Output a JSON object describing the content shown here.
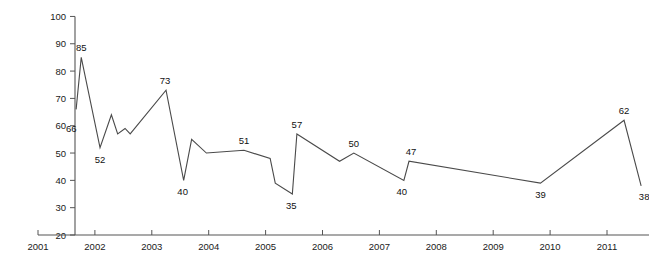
{
  "chart_data": {
    "type": "line",
    "title": "",
    "xlabel": "",
    "ylabel": "",
    "xlim": [
      2001,
      2011.8
    ],
    "ylim": [
      20,
      100
    ],
    "ytick_step": 10,
    "grid": false,
    "legend": null,
    "line_color": "#4a4a4a",
    "axis_color": "#555555",
    "yticks": [
      20,
      30,
      40,
      50,
      60,
      70,
      80,
      90,
      100
    ],
    "ytick_labels": [
      "20",
      "30",
      "40",
      "50",
      "60",
      "70",
      "80",
      "90",
      "100"
    ],
    "xticks": [
      2001,
      2002,
      2003,
      2004,
      2005,
      2006,
      2007,
      2008,
      2009,
      2010,
      2011
    ],
    "xtick_labels": [
      "2001",
      "2002",
      "2003",
      "2004",
      "2005",
      "2006",
      "2007",
      "2008",
      "2009",
      "2010",
      "2011"
    ],
    "series": [
      {
        "name": "series-1",
        "points": [
          {
            "x": 2001.67,
            "y": 66
          },
          {
            "x": 2001.76,
            "y": 85
          },
          {
            "x": 2002.09,
            "y": 52
          },
          {
            "x": 2002.29,
            "y": 64
          },
          {
            "x": 2002.4,
            "y": 57
          },
          {
            "x": 2002.53,
            "y": 59
          },
          {
            "x": 2002.62,
            "y": 57
          },
          {
            "x": 2003.25,
            "y": 73
          },
          {
            "x": 2003.56,
            "y": 40
          },
          {
            "x": 2003.7,
            "y": 55
          },
          {
            "x": 2003.96,
            "y": 50
          },
          {
            "x": 2004.62,
            "y": 51
          },
          {
            "x": 2005.08,
            "y": 48
          },
          {
            "x": 2005.17,
            "y": 39
          },
          {
            "x": 2005.47,
            "y": 35
          },
          {
            "x": 2005.55,
            "y": 57
          },
          {
            "x": 2006.3,
            "y": 47
          },
          {
            "x": 2006.55,
            "y": 50
          },
          {
            "x": 2007.43,
            "y": 40
          },
          {
            "x": 2007.52,
            "y": 47
          },
          {
            "x": 2009.83,
            "y": 39
          },
          {
            "x": 2011.3,
            "y": 62
          },
          {
            "x": 2011.6,
            "y": 38
          }
        ]
      }
    ],
    "data_labels": [
      {
        "text": "66",
        "x": 2001.62,
        "y": 63,
        "dx": -2,
        "dy": 14
      },
      {
        "text": "85",
        "x": 2001.76,
        "y": 85,
        "dx": 0,
        "dy": -6
      },
      {
        "text": "52",
        "x": 2002.09,
        "y": 52,
        "dx": 0,
        "dy": 15
      },
      {
        "text": "73",
        "x": 2003.25,
        "y": 73,
        "dx": -1,
        "dy": -6
      },
      {
        "text": "40",
        "x": 2003.56,
        "y": 40,
        "dx": -1,
        "dy": 15
      },
      {
        "text": "51",
        "x": 2004.62,
        "y": 51,
        "dx": 0,
        "dy": -6
      },
      {
        "text": "35",
        "x": 2005.47,
        "y": 35,
        "dx": -1,
        "dy": 15
      },
      {
        "text": "57",
        "x": 2005.55,
        "y": 57,
        "dx": 0,
        "dy": -6
      },
      {
        "text": "50",
        "x": 2006.55,
        "y": 50,
        "dx": 0,
        "dy": -6
      },
      {
        "text": "40",
        "x": 2007.43,
        "y": 40,
        "dx": -2,
        "dy": 15
      },
      {
        "text": "47",
        "x": 2007.52,
        "y": 47,
        "dx": 2,
        "dy": -6
      },
      {
        "text": "39",
        "x": 2009.83,
        "y": 39,
        "dx": 0,
        "dy": 15
      },
      {
        "text": "62",
        "x": 2011.3,
        "y": 62,
        "dx": 0,
        "dy": -6
      },
      {
        "text": "38",
        "x": 2011.6,
        "y": 38,
        "dx": 3,
        "dy": 14
      }
    ]
  },
  "plot_geometry": {
    "x_axis_y": 235,
    "y_axis_x": 75,
    "x_origin_px": 38,
    "x_px_per_year": 56.9,
    "y_origin_px": 235,
    "y_px_per_unit": 2.732,
    "axis_right_px": 649,
    "axis_top_px": 13
  }
}
